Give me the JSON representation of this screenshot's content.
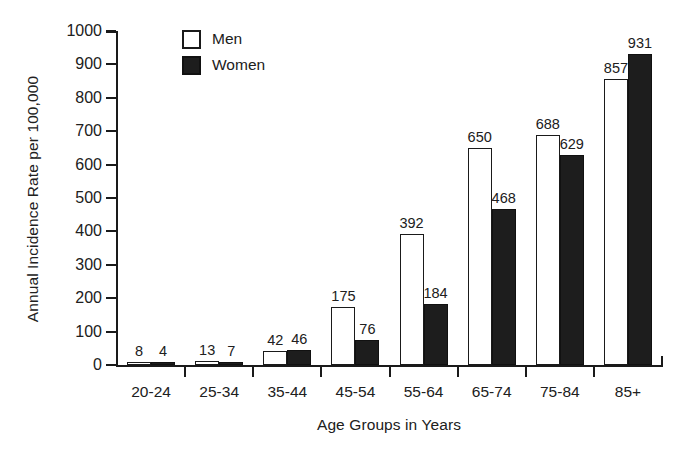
{
  "chart_data": {
    "type": "bar",
    "title": "",
    "xlabel": "Age Groups in Years",
    "ylabel": "Annual Incidence Rate per 100,000",
    "categories": [
      "20-24",
      "25-34",
      "35-44",
      "45-54",
      "55-64",
      "65-74",
      "75-84",
      "85+"
    ],
    "series": [
      {
        "name": "Men",
        "style": "open",
        "values": [
          8,
          13,
          42,
          175,
          392,
          650,
          688,
          857
        ]
      },
      {
        "name": "Women",
        "style": "filled",
        "values": [
          4,
          7,
          46,
          76,
          184,
          468,
          629,
          931
        ]
      }
    ],
    "ylim": [
      0,
      1000
    ],
    "yticks": [
      0,
      100,
      200,
      300,
      400,
      500,
      600,
      700,
      800,
      900,
      1000
    ],
    "ytick_labels": [
      "0",
      "100",
      "200",
      "300",
      "400",
      "500",
      "600",
      "700",
      "800",
      "900",
      "1000"
    ],
    "grid": false,
    "legend_position": "top-left-inside",
    "legend": [
      "Men",
      "Women"
    ],
    "value_labels_shown": true,
    "colors": {
      "men_fill": "#ffffff",
      "women_fill": "#1d1d1d",
      "outline": "#1a1a1a",
      "text": "#202020",
      "background": "#ffffff"
    }
  }
}
